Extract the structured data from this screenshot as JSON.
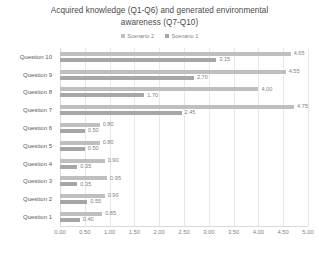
{
  "chart_data": {
    "type": "bar",
    "orientation": "horizontal",
    "title": "Acquired knowledge (Q1-Q6) and generated environmental awareness (Q7-Q10)",
    "title_line1": "Acquired knowledge (Q1-Q6) and generated environmental",
    "title_line2": "awareness (Q7-Q10)",
    "xlabel": "",
    "ylabel": "",
    "xlim": [
      0,
      5
    ],
    "xticks": [
      "0.00",
      "0.50",
      "1.00",
      "1.50",
      "2.00",
      "2.50",
      "3.00",
      "3.50",
      "4.00",
      "4.50",
      "5.00"
    ],
    "grid": true,
    "legend_position": "top",
    "categories": [
      "Question 10",
      "Question 9",
      "Question 8",
      "Question 7",
      "Question 6",
      "Question 5",
      "Question 4",
      "Question 3",
      "Question 2",
      "Question 1"
    ],
    "series": [
      {
        "name": "Scenario 2",
        "color": "#bfbfbf",
        "values": [
          4.65,
          4.55,
          4.0,
          4.75,
          0.8,
          0.8,
          0.9,
          0.95,
          0.9,
          0.85
        ],
        "labels": [
          "4.65",
          "4.55",
          "4.00",
          "4.75",
          "0.80",
          "0.80",
          "0.90",
          "0.95",
          "0.90",
          "0.85"
        ]
      },
      {
        "name": "Scenario 1",
        "color": "#a6a6a6",
        "values": [
          3.15,
          2.7,
          1.7,
          2.45,
          0.5,
          0.5,
          0.35,
          0.35,
          0.55,
          0.4
        ],
        "labels": [
          "3.15",
          "2.70",
          "1.70",
          "2.45",
          "0.50",
          "0.50",
          "0.35",
          "0.35",
          "0.55",
          "0.40"
        ]
      }
    ]
  },
  "legend": {
    "items": [
      {
        "label": "Scenario 2",
        "color": "#bfbfbf"
      },
      {
        "label": "Scenario 1",
        "color": "#a6a6a6"
      }
    ]
  },
  "colors": {
    "scenario2": "#bfbfbf",
    "scenario1": "#a6a6a6",
    "gridline": "#e8e8e8",
    "text": "#7f7f7f",
    "background": "#ffffff"
  }
}
